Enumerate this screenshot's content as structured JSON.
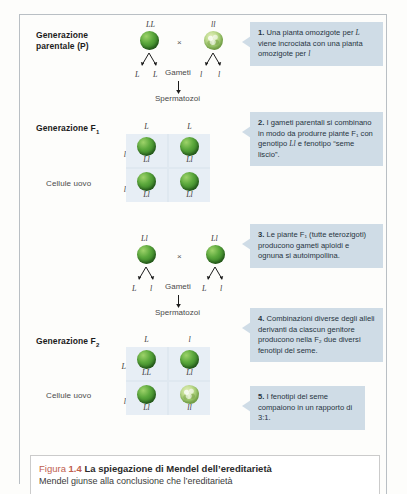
{
  "figure": {
    "caption_prefix": "Figura",
    "caption_number": "1.4",
    "caption_title": "La spiegazione di Mendel dell’ereditarietà",
    "caption_body": "Mendel giunse alla conclusione che l’ereditarietà"
  },
  "colors": {
    "callout_bg": "#cfdce6",
    "punnett_cell": "#e7eef5",
    "punnett_grid": "#dfe8f0",
    "seed_smooth": "#4d9a33",
    "seed_wrinkled": "#b5d488",
    "caption_accent": "#c0604e",
    "rule": "#b9bfc4"
  },
  "parental": {
    "label_line1": "Generazione",
    "label_line2": "parentale (P)",
    "parent_left_genotype": "LL",
    "parent_right_genotype": "ll",
    "cross_symbol": "×",
    "gametes_label": "Gameti",
    "sperm_label": "Spermatozoi",
    "left_gametes": [
      "L",
      "L"
    ],
    "right_gametes": [
      "l",
      "l"
    ]
  },
  "f1": {
    "label": "Generazione F",
    "label_sub": "1",
    "egg_label": "Cellule uovo",
    "sperm_label": "Spermatozoi",
    "columns": [
      "L",
      "L"
    ],
    "rows": [
      "l",
      "l"
    ],
    "cells": [
      {
        "genotype": "Ll",
        "seed": "smooth"
      },
      {
        "genotype": "Ll",
        "seed": "smooth"
      },
      {
        "genotype": "Ll",
        "seed": "smooth"
      },
      {
        "genotype": "Ll",
        "seed": "smooth"
      }
    ]
  },
  "f1cross": {
    "left_genotype": "Ll",
    "right_genotype": "Ll",
    "cross_symbol": "×",
    "gametes_label": "Gameti",
    "sperm_label": "Spermatozoi",
    "left_gametes": [
      "L",
      "l"
    ],
    "right_gametes": [
      "L",
      "l"
    ]
  },
  "f2": {
    "label": "Generazione F",
    "label_sub": "2",
    "egg_label": "Cellule uovo",
    "sperm_label": "Spermatozoi",
    "columns": [
      "L",
      "l"
    ],
    "rows": [
      "L",
      "l"
    ],
    "cells": [
      {
        "genotype": "LL",
        "seed": "smooth"
      },
      {
        "genotype": "Ll",
        "seed": "smooth"
      },
      {
        "genotype": "Ll",
        "seed": "smooth"
      },
      {
        "genotype": "ll",
        "seed": "wrinkled"
      }
    ]
  },
  "callouts": [
    {
      "number": "1.",
      "text_a": " Una pianta omozigote per ",
      "allele_a": "L",
      "text_b": " viene incrociata con una pianta omozigote per ",
      "allele_b": "l",
      "text_c": ""
    },
    {
      "number": "2.",
      "text_a": " I gameti parentali si combinano in modo da produrre piante F₁ con genotipo ",
      "allele_a": "Ll",
      "text_b": " e fenotipo “seme liscio”.",
      "allele_b": "",
      "text_c": ""
    },
    {
      "number": "3.",
      "text_a": " Le piante F₁ (tutte eterozigoti) producono gameti aploidi e ognuna si autoimpollina.",
      "allele_a": "",
      "text_b": "",
      "allele_b": "",
      "text_c": ""
    },
    {
      "number": "4.",
      "text_a": " Combinazioni diverse degli alleli derivanti da ciascun genitore producono nella F₂ due diversi fenotipi del seme.",
      "allele_a": "",
      "text_b": "",
      "allele_b": "",
      "text_c": ""
    },
    {
      "number": "5.",
      "text_a": " I fenotipi del seme compaiono in un rapporto di 3:1.",
      "allele_a": "",
      "text_b": "",
      "allele_b": "",
      "text_c": ""
    }
  ]
}
